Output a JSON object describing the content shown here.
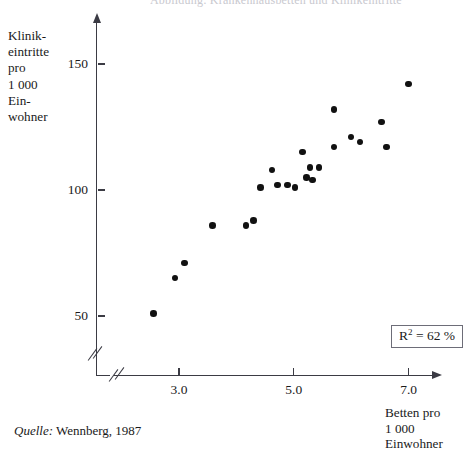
{
  "figure": {
    "cut_title": "Abbildung: Krankenhausbetten und Klinikeintritte",
    "source_prefix": "Quelle:",
    "source_text": "Wennberg, 1987",
    "annotation": {
      "label": "R",
      "exponent": "2",
      "value": "= 62 %"
    },
    "point_color": "#111111",
    "axis_color": "#3b3b44"
  },
  "chart_data": {
    "type": "scatter",
    "title": "",
    "xlabel": "Betten pro\n1 000 Einwohner",
    "ylabel": "Klinik-\neintritte\npro\n1 000\nEin-\nwohner",
    "xlim": [
      2.3,
      7.55
    ],
    "ylim": [
      42,
      155
    ],
    "grid": false,
    "legend": null,
    "xticks": [
      "3.0",
      "5.0",
      "7.0"
    ],
    "xtick_values": [
      3.0,
      5.0,
      7.0
    ],
    "yticks": [
      "150",
      "100",
      "50"
    ],
    "ytick_values": [
      150,
      100,
      50
    ],
    "axis_break": true,
    "r_squared_percent": 62,
    "n_points": 23,
    "points": [
      {
        "x": 2.56,
        "y": 51
      },
      {
        "x": 2.93,
        "y": 65
      },
      {
        "x": 3.1,
        "y": 71
      },
      {
        "x": 3.58,
        "y": 86
      },
      {
        "x": 4.17,
        "y": 86
      },
      {
        "x": 4.3,
        "y": 88
      },
      {
        "x": 4.42,
        "y": 101
      },
      {
        "x": 4.62,
        "y": 108
      },
      {
        "x": 4.72,
        "y": 102
      },
      {
        "x": 4.89,
        "y": 102
      },
      {
        "x": 5.02,
        "y": 101
      },
      {
        "x": 5.15,
        "y": 115
      },
      {
        "x": 5.22,
        "y": 105
      },
      {
        "x": 5.28,
        "y": 109
      },
      {
        "x": 5.33,
        "y": 104
      },
      {
        "x": 5.44,
        "y": 109
      },
      {
        "x": 5.7,
        "y": 132
      },
      {
        "x": 5.7,
        "y": 117
      },
      {
        "x": 6.0,
        "y": 121
      },
      {
        "x": 6.15,
        "y": 119
      },
      {
        "x": 6.53,
        "y": 127
      },
      {
        "x": 6.62,
        "y": 117
      },
      {
        "x": 7.0,
        "y": 142
      }
    ]
  }
}
